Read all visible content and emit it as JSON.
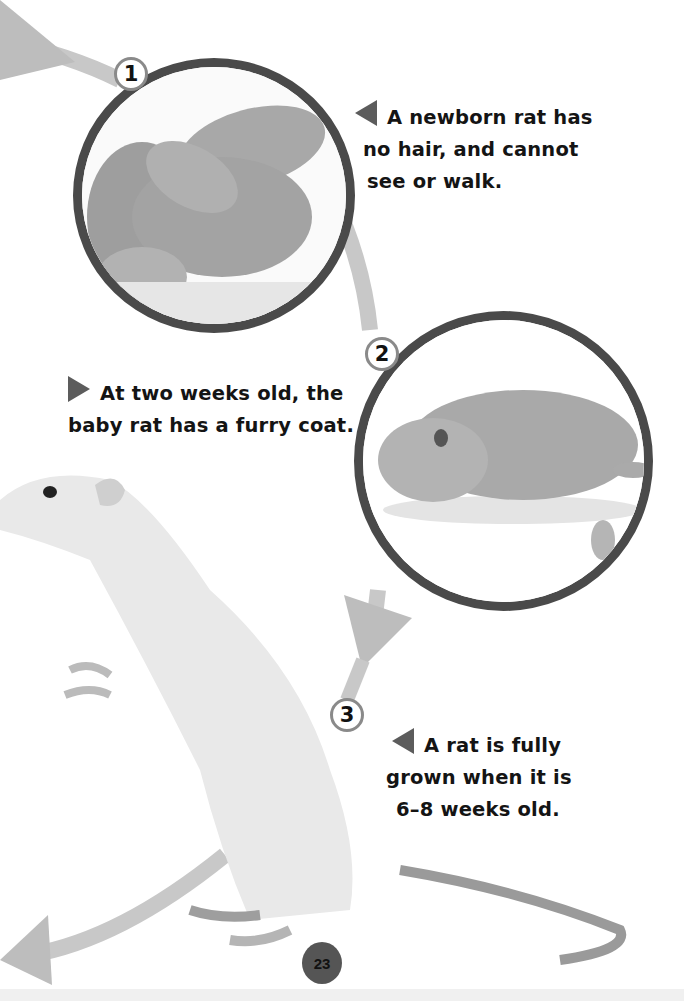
{
  "page": {
    "page_number": "23",
    "colors": {
      "circle_border": "#4a4a4a",
      "path_arrow": "#c4c4c4",
      "caption_triangle": "#5c5c5c",
      "text": "#141414"
    }
  },
  "stages": [
    {
      "number": "1",
      "photo": "newborn-rats-photo",
      "caption_lines": [
        "A newborn rat has",
        "no hair, and cannot",
        "see or walk."
      ],
      "pointer": "left"
    },
    {
      "number": "2",
      "photo": "two-week-old-rat-photo",
      "caption_lines": [
        "At two weeks old, the",
        "baby rat has a furry coat."
      ],
      "pointer": "right"
    },
    {
      "number": "3",
      "photo": "adult-rat-photo",
      "caption_lines": [
        "A rat is fully",
        "grown when it is",
        "6–8 weeks old."
      ],
      "pointer": "left"
    }
  ]
}
